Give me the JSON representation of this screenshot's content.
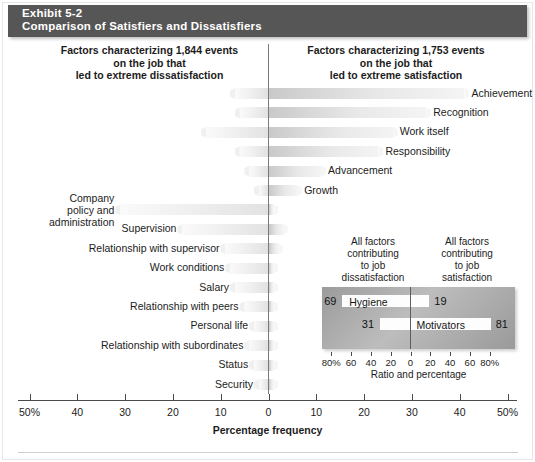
{
  "header": {
    "exhibit": "Exhibit 5-2",
    "title": "Comparison of Satisfiers and Dissatisfiers",
    "bg_color": "#565656",
    "text_color": "#ffffff"
  },
  "captions": {
    "left": "Factors characterizing 1,844 events\non the job that\nled to extreme dissatisfaction",
    "right": "Factors characterizing 1,753 events\non the job that\nled to extreme satisfaction"
  },
  "axis": {
    "title": "Percentage frequency",
    "tick_labels": [
      "50%",
      "40",
      "30",
      "20",
      "10",
      "0",
      "10",
      "20",
      "30",
      "40",
      "50%"
    ],
    "tick_values": [
      -50,
      -40,
      -30,
      -20,
      -10,
      0,
      10,
      20,
      30,
      40,
      50
    ]
  },
  "inset": {
    "caption_left": "All factors\ncontributing\nto job\ndissatisfaction",
    "caption_right": "All factors\ncontributing\nto job\nsatisfaction",
    "title": "Ratio and percentage",
    "tick_labels": [
      "80%",
      "60",
      "40",
      "20",
      "0",
      "20",
      "40",
      "60",
      "80%"
    ],
    "tick_values": [
      -80,
      -60,
      -40,
      -20,
      0,
      20,
      40,
      60,
      80
    ],
    "rows": [
      {
        "name": "Hygiene",
        "left_value": 69,
        "right_value": 19,
        "left_label": "69",
        "right_label": "19"
      },
      {
        "name": "Motivators",
        "left_value": 31,
        "right_value": 81,
        "left_label": "31",
        "right_label": "81"
      }
    ],
    "box_color": "#a8a8a8",
    "bar_color": "#fdfdfd"
  },
  "chart_data": {
    "type": "bar",
    "title": "Comparison of Satisfiers and Dissatisfiers",
    "subtitle": "Exhibit 5-2",
    "orientation": "horizontal-diverging",
    "xlabel": "Percentage frequency",
    "ylabel": "",
    "xlim": [
      -50,
      50
    ],
    "xticks": [
      -50,
      -40,
      -30,
      -20,
      -10,
      0,
      10,
      20,
      30,
      40,
      50
    ],
    "xticklabels": [
      "50%",
      "40",
      "30",
      "20",
      "10",
      "0",
      "10",
      "20",
      "30",
      "40",
      "50%"
    ],
    "grid": false,
    "legend": "none",
    "note": "Negative (left) values = percent frequency of extreme dissatisfaction; positive (right) values = percent frequency of extreme satisfaction.",
    "categories": [
      "Achievement",
      "Recognition",
      "Work itself",
      "Responsibility",
      "Advancement",
      "Growth",
      "Company policy and administration",
      "Supervision",
      "Relationship with supervisor",
      "Work conditions",
      "Salary",
      "Relationship with peers",
      "Personal life",
      "Relationship with subordinates",
      "Status",
      "Security"
    ],
    "series": [
      {
        "name": "Extreme satisfaction (right, positive)",
        "values": [
          41,
          33,
          26,
          23,
          11,
          6,
          1,
          3,
          2,
          1,
          1,
          1,
          0,
          1,
          1,
          1
        ]
      },
      {
        "name": "Extreme dissatisfaction (left, negative)",
        "values": [
          -7,
          -6,
          -13,
          -6,
          -4,
          -2,
          -31,
          -18,
          -9,
          -8,
          -7,
          -5,
          -3,
          -4,
          -3,
          -2
        ]
      }
    ],
    "bars": [
      {
        "label": "Achievement",
        "side": "satisfaction",
        "left": -7,
        "right": 41,
        "label_side": "right"
      },
      {
        "label": "Recognition",
        "side": "satisfaction",
        "left": -6,
        "right": 33,
        "label_side": "right"
      },
      {
        "label": "Work itself",
        "side": "satisfaction",
        "left": -13,
        "right": 26,
        "label_side": "right"
      },
      {
        "label": "Responsibility",
        "side": "satisfaction",
        "left": -6,
        "right": 23,
        "label_side": "right"
      },
      {
        "label": "Advancement",
        "side": "satisfaction",
        "left": -4,
        "right": 11,
        "label_side": "right"
      },
      {
        "label": "Growth",
        "side": "satisfaction",
        "left": -2,
        "right": 6,
        "label_side": "right"
      },
      {
        "label": "Company\npolicy and\nadministration",
        "side": "dissatisfaction",
        "left": -31,
        "right": 1,
        "label_side": "left"
      },
      {
        "label": "Supervision",
        "side": "dissatisfaction",
        "left": -18,
        "right": 3,
        "label_side": "left"
      },
      {
        "label": "Relationship with supervisor",
        "side": "dissatisfaction",
        "left": -9,
        "right": 2,
        "label_side": "left"
      },
      {
        "label": "Work conditions",
        "side": "dissatisfaction",
        "left": -8,
        "right": 1,
        "label_side": "left"
      },
      {
        "label": "Salary",
        "side": "dissatisfaction",
        "left": -7,
        "right": 1,
        "label_side": "left"
      },
      {
        "label": "Relationship with peers",
        "side": "dissatisfaction",
        "left": -5,
        "right": 1,
        "label_side": "left"
      },
      {
        "label": "Personal life",
        "side": "dissatisfaction",
        "left": -3,
        "right": 1,
        "label_side": "left"
      },
      {
        "label": "Relationship with subordinates",
        "side": "dissatisfaction",
        "left": -4,
        "right": 1,
        "label_side": "left"
      },
      {
        "label": "Status",
        "side": "dissatisfaction",
        "left": -3,
        "right": 1,
        "label_side": "left"
      },
      {
        "label": "Security",
        "side": "dissatisfaction",
        "left": -2,
        "right": 1,
        "label_side": "left"
      }
    ]
  }
}
